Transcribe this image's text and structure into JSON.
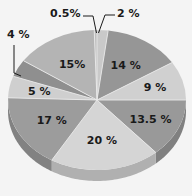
{
  "chart_data": {
    "type": "pie",
    "title": "",
    "subtitle": "",
    "xlabel": "",
    "ylabel": "",
    "legend": [],
    "legend_position": "none",
    "grid": false,
    "three_d": true,
    "units": "percent",
    "total": 100,
    "start_angle_deg": 0,
    "direction": "clockwise",
    "background_color": "#f4f4f4",
    "categories": [
      "2 %",
      "14 %",
      "9 %",
      "13.5 %",
      "20 %",
      "17 %",
      "5 %",
      "4 %",
      "15%",
      "0.5%"
    ],
    "values": [
      2,
      14,
      9,
      13.5,
      20,
      17,
      5,
      4,
      15,
      0.5
    ],
    "labels": [
      "2 %",
      "14 %",
      "9 %",
      "13.5 %",
      "20 %",
      "17 %",
      "5 %",
      "4 %",
      "15%",
      "0.5%"
    ],
    "slices": [
      {
        "label": "2 %",
        "value": 2,
        "color": "#c9c9c9",
        "side_color": "#a8a8a8",
        "label_placement": "callout-top-right"
      },
      {
        "label": "14 %",
        "value": 14,
        "color": "#969696",
        "side_color": "#7d7d7d",
        "label_placement": "inside"
      },
      {
        "label": "9 %",
        "value": 9,
        "color": "#d0d0d0",
        "side_color": "#ababab",
        "label_placement": "inside"
      },
      {
        "label": "13.5 %",
        "value": 13.5,
        "color": "#999999",
        "side_color": "#808080",
        "label_placement": "inside"
      },
      {
        "label": "20 %",
        "value": 20,
        "color": "#d5d5d5",
        "side_color": "#b0b0b0",
        "label_placement": "inside"
      },
      {
        "label": "17 %",
        "value": 17,
        "color": "#9c9c9c",
        "side_color": "#828282",
        "label_placement": "inside"
      },
      {
        "label": "5 %",
        "value": 5,
        "color": "#cfcfcf",
        "side_color": "#aaaaaa",
        "label_placement": "inside"
      },
      {
        "label": "4 %",
        "value": 4,
        "color": "#8f8f8f",
        "side_color": "#787878",
        "label_placement": "callout-left"
      },
      {
        "label": "15%",
        "value": 15,
        "color": "#b4b4b4",
        "side_color": "#949494",
        "label_placement": "inside"
      },
      {
        "label": "0.5%",
        "value": 0.5,
        "color": "#bdbdbd",
        "side_color": "#9d9d9d",
        "label_placement": "callout-top-left"
      }
    ]
  },
  "callouts": {
    "left_label": "4 %",
    "top_left_label": "0.5%",
    "top_right_label": "2 %"
  }
}
